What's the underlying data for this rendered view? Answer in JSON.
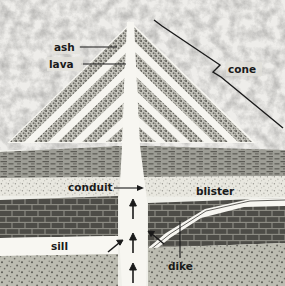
{
  "figure": {
    "width": 285,
    "height": 286
  },
  "labels": {
    "ash": "ash",
    "lava": "lava",
    "cone": "cone",
    "conduit": "conduit",
    "blister": "blister",
    "sill": "sill",
    "dike": "dike"
  },
  "colors": {
    "sky": "#d8d8d2",
    "ash_layer": "#8d8d86",
    "lava_layer": "#f6f5f0",
    "shale": "#9a9a92",
    "sandstone": "#e6e5dd",
    "limestone": "#4f4e49",
    "granite": "#b9b9ae",
    "conduit": "#f7f6f1",
    "line": "#1a1a1a",
    "label_text": "#1a1a1a"
  },
  "strata": [
    {
      "name": "shale",
      "pattern": "horizontal-dashes",
      "top": 146,
      "bottom": 176
    },
    {
      "name": "sandstone",
      "pattern": "fine-stipple",
      "top": 176,
      "bottom": 196
    },
    {
      "name": "limestone",
      "pattern": "brick",
      "top": 196,
      "bottom": 236
    },
    {
      "name": "sill",
      "pattern": "blank-white",
      "top": 232,
      "bottom": 252
    },
    {
      "name": "granite",
      "pattern": "coarse-stipple",
      "top": 252,
      "bottom": 286
    }
  ],
  "cone": {
    "summit_x": 131,
    "summit_y": 22,
    "band_count": 5,
    "band_type": "alternating ash and lava"
  },
  "flow_arrows": {
    "count": 5,
    "vertical_up": 3,
    "diagonal_into_conduit": 2,
    "direction": "upward"
  }
}
